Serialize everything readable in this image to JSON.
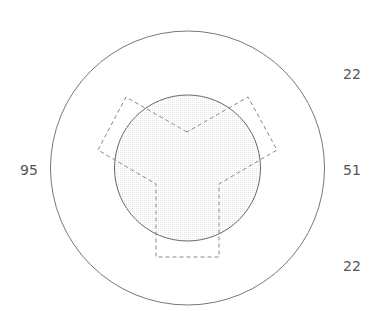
{
  "diagram": {
    "labels": {
      "left": "95",
      "top_right": "22",
      "middle_right": "51",
      "bottom_right": "22"
    },
    "colors": {
      "circle_stroke": "#777777",
      "dash_stroke": "#888888",
      "fill": "#f4f4f4",
      "label": "#555555"
    }
  }
}
